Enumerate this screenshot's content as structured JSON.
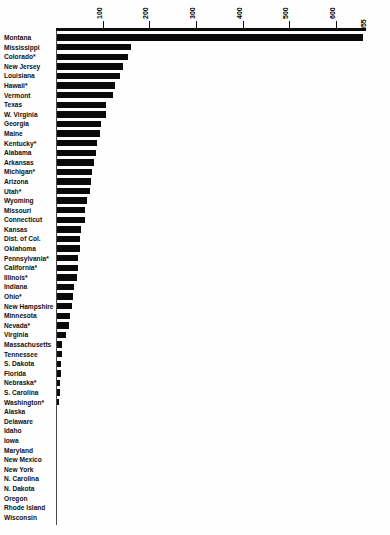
{
  "chart_data": {
    "type": "bar",
    "orientation": "horizontal",
    "title": "",
    "subtitle": "",
    "xlabel": "",
    "ylabel": "",
    "xlim": [
      0,
      700
    ],
    "grid": false,
    "legend": null,
    "axis_position": "top",
    "tick_labels": [
      "100",
      "200",
      "300",
      "400",
      "500",
      "600"
    ],
    "tick_values": [
      100,
      200,
      300,
      400,
      500,
      600
    ],
    "value_annotations": [
      {
        "category": "Montana",
        "label": "955",
        "position": "bar-end"
      }
    ],
    "note": "Montana bar is truncated at the plot edge and annotated with its value 955",
    "categories": [
      "Montana",
      "Mississippi",
      "Colorado*",
      "New Jersey",
      "Louisiana",
      "Hawaii*",
      "Vermont",
      "Texas",
      "W. Virginia",
      "Georgia",
      "Maine",
      "Kentucky*",
      "Alabama",
      "Arkansas",
      "Michigan*",
      "Arizona",
      "Utah*",
      "Wyoming",
      "Missouri",
      "Connecticut",
      "Kansas",
      "Dist. of Col.",
      "Oklahoma",
      "Pennsylvania*",
      "California*",
      "Illinois*",
      "Indiana",
      "Ohio*",
      "New Hampshire",
      "Minnesota",
      "Nevada*",
      "Virginia",
      "Massachusetts",
      "Tennessee",
      "S. Dakota",
      "Florida",
      "Nebraska*",
      "S. Carolina",
      "Washington*",
      "Alaska",
      "Delaware",
      "Idaho",
      "Iowa",
      "Maryland",
      "New Mexico",
      "New York",
      "N. Carolina",
      "N. Dakota",
      "Oregon",
      "Rhode Island",
      "Wisconsin"
    ],
    "values": [
      955,
      158,
      152,
      141,
      136,
      124,
      121,
      104,
      104,
      95,
      92,
      85,
      84,
      80,
      76,
      72,
      71,
      64,
      61,
      60,
      52,
      50,
      49,
      46,
      44,
      43,
      36,
      34,
      32,
      27,
      26,
      20,
      11,
      10,
      9,
      8,
      7,
      6,
      5,
      0,
      0,
      0,
      0,
      0,
      0,
      0,
      0,
      0,
      0,
      0,
      0
    ]
  }
}
